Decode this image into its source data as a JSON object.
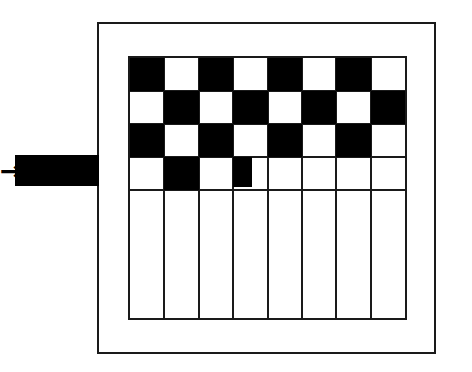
{
  "figure": {
    "width": 472,
    "height": 372,
    "background_color": "#ffffff",
    "line_color": "#1a1a1a",
    "fill_color": "#000000"
  },
  "outer_box": {
    "name": "outer-enclosure",
    "x": 97,
    "y": 22,
    "width": 339,
    "height": 332,
    "border_width": 2,
    "border_color": "#1a1a1a"
  },
  "grid": {
    "name": "checkerboard-panel",
    "x": 128,
    "y": 56,
    "width": 279,
    "height": 264,
    "columns": 8,
    "rows": 8,
    "cell_width": 34.9,
    "cell_height": 33,
    "border_width": 2,
    "border_color": "#1a1a1a",
    "pattern_rows": [
      [
        "black",
        "white",
        "black",
        "white",
        "black",
        "white",
        "black",
        "white"
      ],
      [
        "white",
        "black",
        "white",
        "black",
        "white",
        "black",
        "white",
        "black"
      ],
      [
        "black",
        "white",
        "black",
        "white",
        "black",
        "white",
        "black",
        "white"
      ],
      [
        "white",
        "black",
        "white",
        "partial",
        "white",
        "white",
        "white",
        "white"
      ]
    ],
    "filled_row_count": 4,
    "empty_row_count": 4,
    "partial_block": {
      "name": "partial-black-block",
      "column_index": 3,
      "row_index": 3,
      "width_fraction": 0.55,
      "height_fraction": 0.9
    }
  },
  "feed": {
    "name": "input-feed",
    "bar": {
      "x": 15,
      "y": 155,
      "width": 84,
      "height": 31,
      "color": "#000000"
    },
    "arrow": {
      "glyph": "→",
      "x": 0,
      "y": 158,
      "label": "arrow-right"
    }
  },
  "legend": {
    "black_label": "filled",
    "white_label": "empty"
  },
  "chart_data": {
    "type": "heatmap",
    "title": "",
    "xlabel": "",
    "ylabel": "",
    "columns": 8,
    "rows": 8,
    "values": [
      [
        1,
        0,
        1,
        0,
        1,
        0,
        1,
        0
      ],
      [
        0,
        1,
        0,
        1,
        0,
        1,
        0,
        1
      ],
      [
        1,
        0,
        1,
        0,
        1,
        0,
        1,
        0
      ],
      [
        0,
        1,
        0,
        0.5,
        0,
        0,
        0,
        0
      ],
      [
        0,
        0,
        0,
        0,
        0,
        0,
        0,
        0
      ],
      [
        0,
        0,
        0,
        0,
        0,
        0,
        0,
        0
      ],
      [
        0,
        0,
        0,
        0,
        0,
        0,
        0,
        0
      ],
      [
        0,
        0,
        0,
        0,
        0,
        0,
        0,
        0
      ]
    ],
    "legend": [
      "filled = 1 (black)",
      "empty = 0 (white)",
      "partial = 0.5"
    ]
  }
}
